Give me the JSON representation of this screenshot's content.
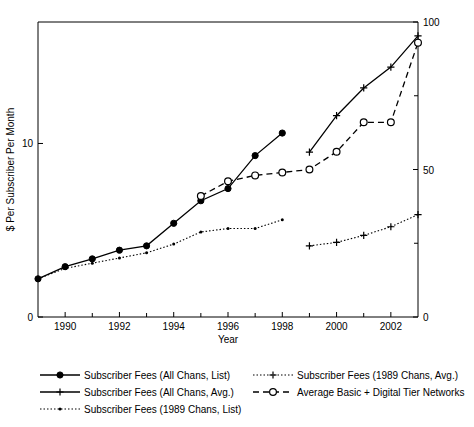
{
  "chart_data": {
    "type": "line",
    "title": "",
    "xlabel": "Year",
    "ylabel": "$ Per Subscriber Per Month",
    "ylabel_right": "",
    "xlim": [
      1989,
      2003
    ],
    "ylim": [
      0,
      17
    ],
    "ylim_right": [
      0,
      100
    ],
    "grid": false,
    "legend_position": "below",
    "xticks": [
      1990,
      1992,
      1994,
      1996,
      1998,
      2000,
      2002
    ],
    "xtick_labels": [
      "1990",
      "1992",
      "1994",
      "1996",
      "1998",
      "2000",
      "2002"
    ],
    "xticks_minor": [
      1989,
      1991,
      1993,
      1995,
      1997,
      1999,
      2001,
      2003
    ],
    "yticks_left": [
      0,
      10
    ],
    "ytick_labels_left": [
      "0",
      "10"
    ],
    "yticks_right": [
      0,
      50,
      100
    ],
    "ytick_labels_right": [
      "0",
      "50",
      "100"
    ],
    "yticks_right_minor": [
      25,
      75
    ],
    "series": [
      {
        "name": "Subscriber Fees (All Chans, List)",
        "axis": "left",
        "line_style": "solid",
        "marker": "filled-circle",
        "x": [
          1989,
          1990,
          1991,
          1992,
          1993,
          1994,
          1995,
          1996,
          1997,
          1998
        ],
        "values": [
          2.2,
          2.9,
          3.35,
          3.85,
          4.1,
          5.4,
          6.7,
          7.4,
          9.3,
          10.6
        ]
      },
      {
        "name": "Subscriber Fees (All Chans, Avg.)",
        "axis": "left",
        "line_style": "solid",
        "marker": "plus",
        "x": [
          1999,
          2000,
          2001,
          2002,
          2003
        ],
        "values": [
          9.5,
          11.6,
          13.2,
          14.4,
          16.2
        ]
      },
      {
        "name": "Subscriber Fees (1989 Chans, List)",
        "axis": "left",
        "line_style": "dotted",
        "marker": "small-dot",
        "x": [
          1989,
          1990,
          1991,
          1992,
          1993,
          1994,
          1995,
          1996,
          1997,
          1998
        ],
        "values": [
          2.2,
          2.8,
          3.1,
          3.4,
          3.7,
          4.2,
          4.9,
          5.1,
          5.1,
          5.6
        ]
      },
      {
        "name": "Subscriber Fees (1989 Chans, Avg.)",
        "axis": "left",
        "line_style": "dotted",
        "marker": "plus",
        "x": [
          1999,
          2000,
          2001,
          2002,
          2003
        ],
        "values": [
          4.1,
          4.3,
          4.7,
          5.2,
          5.9
        ]
      },
      {
        "name": "Average Basic + Digital Tier Networks",
        "axis": "right",
        "line_style": "dashed",
        "marker": "open-circle",
        "x": [
          1995,
          1996,
          1997,
          1998,
          1999,
          2000,
          2001,
          2002,
          2003
        ],
        "values": [
          41,
          46,
          48,
          49,
          50,
          56,
          66,
          66,
          93
        ]
      }
    ]
  },
  "legend": {
    "entries": [
      {
        "label": "Subscriber Fees (All Chans, List)",
        "line_style": "solid",
        "marker": "filled-circle",
        "column": 0,
        "row": 0
      },
      {
        "label": "Subscriber Fees (All Chans, Avg.)",
        "line_style": "solid",
        "marker": "plus",
        "column": 0,
        "row": 1
      },
      {
        "label": "Subscriber Fees (1989 Chans, List)",
        "line_style": "dotted",
        "marker": "small-dot",
        "column": 0,
        "row": 2
      },
      {
        "label": "Subscriber Fees (1989 Chans, Avg.)",
        "line_style": "dotted",
        "marker": "plus",
        "column": 1,
        "row": 0
      },
      {
        "label": "Average Basic + Digital Tier Networks",
        "line_style": "dashed",
        "marker": "open-circle",
        "column": 1,
        "row": 1
      }
    ]
  },
  "colors": {
    "ink": "#000000",
    "background": "#ffffff"
  }
}
